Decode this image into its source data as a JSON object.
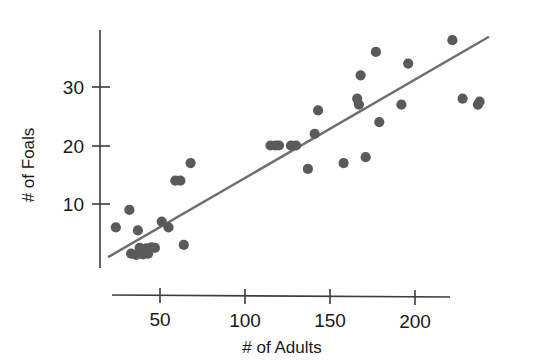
{
  "chart_data": {
    "type": "scatter",
    "title": "",
    "xlabel": "# of Adults",
    "ylabel": "# of Foals",
    "xticks": [
      50,
      100,
      150,
      200
    ],
    "yticks": [
      10,
      20,
      30
    ],
    "xtick_labels": [
      "50",
      "100",
      "150",
      "200"
    ],
    "ytick_labels": [
      "10",
      "20",
      "30"
    ],
    "xlim": [
      18,
      245
    ],
    "ylim": [
      0,
      39
    ],
    "grid": false,
    "legend": null,
    "marker_color": "#5a5a5a",
    "trendline_color": "#6e6e6e",
    "axis_color": "#3c3c3c",
    "points": [
      {
        "x": 24,
        "y": 6
      },
      {
        "x": 32,
        "y": 9
      },
      {
        "x": 33,
        "y": 1.5
      },
      {
        "x": 36,
        "y": 1.3
      },
      {
        "x": 37,
        "y": 5.5
      },
      {
        "x": 38,
        "y": 2.5
      },
      {
        "x": 39,
        "y": 2.2
      },
      {
        "x": 40,
        "y": 1.4
      },
      {
        "x": 42,
        "y": 2.4
      },
      {
        "x": 43,
        "y": 1.5
      },
      {
        "x": 45,
        "y": 2.6
      },
      {
        "x": 47,
        "y": 2.5
      },
      {
        "x": 51,
        "y": 7
      },
      {
        "x": 55,
        "y": 6
      },
      {
        "x": 59,
        "y": 14
      },
      {
        "x": 62,
        "y": 14
      },
      {
        "x": 64,
        "y": 3
      },
      {
        "x": 68,
        "y": 17
      },
      {
        "x": 115,
        "y": 20
      },
      {
        "x": 118,
        "y": 20
      },
      {
        "x": 120,
        "y": 20
      },
      {
        "x": 127,
        "y": 20
      },
      {
        "x": 130,
        "y": 20
      },
      {
        "x": 137,
        "y": 16
      },
      {
        "x": 141,
        "y": 22
      },
      {
        "x": 143,
        "y": 26
      },
      {
        "x": 158,
        "y": 17
      },
      {
        "x": 166,
        "y": 28
      },
      {
        "x": 167,
        "y": 27
      },
      {
        "x": 168,
        "y": 32
      },
      {
        "x": 171,
        "y": 18
      },
      {
        "x": 177,
        "y": 36
      },
      {
        "x": 179,
        "y": 24
      },
      {
        "x": 192,
        "y": 27
      },
      {
        "x": 196,
        "y": 34
      },
      {
        "x": 222,
        "y": 38
      },
      {
        "x": 228,
        "y": 28
      },
      {
        "x": 237,
        "y": 27
      },
      {
        "x": 238,
        "y": 27.5
      }
    ],
    "trendline": {
      "x_start": 20,
      "y_start": 1,
      "x_end": 243,
      "y_end": 38.5
    }
  }
}
